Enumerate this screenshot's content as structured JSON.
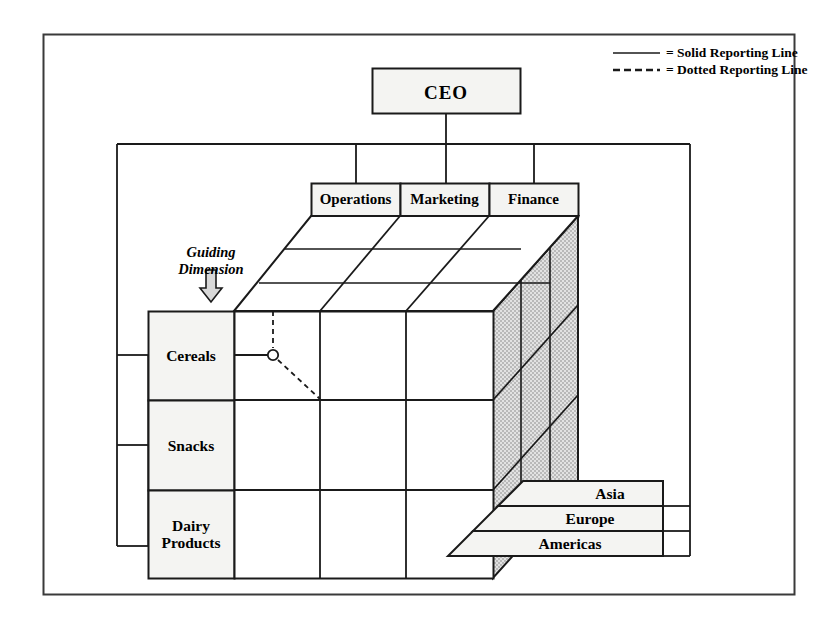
{
  "diagram": {
    "title_box": {
      "label": "CEO"
    },
    "guiding_dimension": {
      "line1": "Guiding",
      "line2": "Dimension"
    },
    "legend": {
      "solid": "= Solid Reporting Line",
      "dotted": "= Dotted Reporting Line"
    },
    "functions": [
      {
        "label": "Operations"
      },
      {
        "label": "Marketing"
      },
      {
        "label": "Finance"
      }
    ],
    "products": [
      {
        "label": "Cereals"
      },
      {
        "label": "Snacks"
      },
      {
        "label": "Dairy\nProducts"
      },
      {
        "line1": "Dairy",
        "line2": "Products"
      }
    ],
    "regions": [
      {
        "label": "Asia"
      },
      {
        "label": "Europe"
      },
      {
        "label": "Americas"
      }
    ],
    "colors": {
      "line": "#1a1a1a",
      "box_fill": "#f4f4f2",
      "side_fill": "#cfcfcf",
      "frame": "#3a3a3a",
      "white": "#ffffff"
    }
  }
}
